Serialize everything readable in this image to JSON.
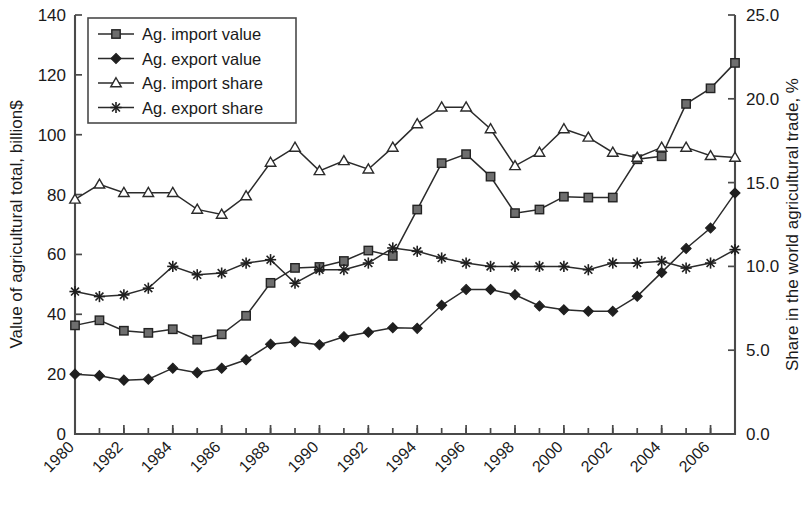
{
  "chart_data": {
    "type": "line",
    "title": "",
    "xlabel": "",
    "ylabel": "Value of agricultural total, billion$",
    "y2label": "Share in the world agricultural trade, %",
    "grid": false,
    "legend_position": "top-left",
    "xlim": [
      1980,
      2007
    ],
    "ylim": [
      0,
      140
    ],
    "y2lim": [
      0.0,
      25.0
    ],
    "ytick_labels": [
      "0",
      "20",
      "40",
      "60",
      "80",
      "100",
      "120",
      "140"
    ],
    "ytick_values": [
      0,
      20,
      40,
      60,
      80,
      100,
      120,
      140
    ],
    "y2tick_labels": [
      "0.0",
      "5.0",
      "10.0",
      "15.0",
      "20.0",
      "25.0"
    ],
    "y2tick_values": [
      0.0,
      5.0,
      10.0,
      15.0,
      20.0,
      25.0
    ],
    "x": [
      1980,
      1981,
      1982,
      1983,
      1984,
      1985,
      1986,
      1987,
      1988,
      1989,
      1990,
      1991,
      1992,
      1993,
      1994,
      1995,
      1996,
      1997,
      1998,
      1999,
      2000,
      2001,
      2002,
      2003,
      2004,
      2005,
      2006,
      2007
    ],
    "xtick_labels": [
      "1980",
      "1982",
      "1984",
      "1986",
      "1988",
      "1990",
      "1992",
      "1994",
      "1996",
      "1998",
      "2000",
      "2002",
      "2004",
      "2006"
    ],
    "xtick_values": [
      1980,
      1982,
      1984,
      1986,
      1988,
      1990,
      1992,
      1994,
      1996,
      1998,
      2000,
      2002,
      2004,
      2006
    ],
    "series": [
      {
        "name": "Ag. import value",
        "marker": "square-filled",
        "axis": "left",
        "values": [
          36.3,
          38.0,
          34.5,
          33.8,
          35.0,
          31.5,
          33.3,
          39.5,
          50.5,
          55.5,
          55.8,
          57.8,
          61.3,
          59.5,
          75.0,
          90.5,
          93.5,
          86.0,
          73.8,
          75.0,
          79.3,
          79.0,
          79.0,
          91.8,
          92.8,
          110.3,
          115.5,
          124.0
        ]
      },
      {
        "name": "Ag. export value",
        "marker": "diamond-filled",
        "axis": "left",
        "values": [
          20.0,
          19.5,
          18.0,
          18.3,
          22.0,
          20.5,
          22.0,
          24.8,
          30.0,
          30.8,
          29.8,
          32.5,
          34.0,
          35.5,
          35.3,
          43.0,
          48.3,
          48.3,
          46.5,
          42.8,
          41.5,
          41.0,
          41.0,
          46.0,
          54.0,
          62.0,
          68.8,
          80.5
        ]
      },
      {
        "name": "Ag. import share",
        "marker": "triangle-open",
        "axis": "right",
        "values": [
          14.0,
          14.9,
          14.4,
          14.4,
          14.4,
          13.4,
          13.1,
          14.2,
          16.2,
          17.1,
          15.7,
          16.3,
          15.8,
          17.1,
          18.5,
          19.5,
          19.5,
          18.2,
          16.0,
          16.8,
          18.2,
          17.7,
          16.8,
          16.5,
          17.1,
          17.1,
          16.6,
          16.5
        ]
      },
      {
        "name": "Ag. export share",
        "marker": "star",
        "axis": "right",
        "values": [
          8.5,
          8.2,
          8.3,
          8.7,
          10.0,
          9.5,
          9.6,
          10.2,
          10.4,
          9.0,
          9.8,
          9.8,
          10.2,
          11.1,
          10.9,
          10.5,
          10.2,
          10.0,
          10.0,
          10.0,
          10.0,
          9.8,
          10.2,
          10.2,
          10.3,
          9.9,
          10.2,
          11.0
        ]
      }
    ]
  },
  "colors": {
    "axis": "#4a4a4a",
    "series_line": "#2b2b2b",
    "marker_fill": "#6e6e6e",
    "background": "#ffffff"
  }
}
